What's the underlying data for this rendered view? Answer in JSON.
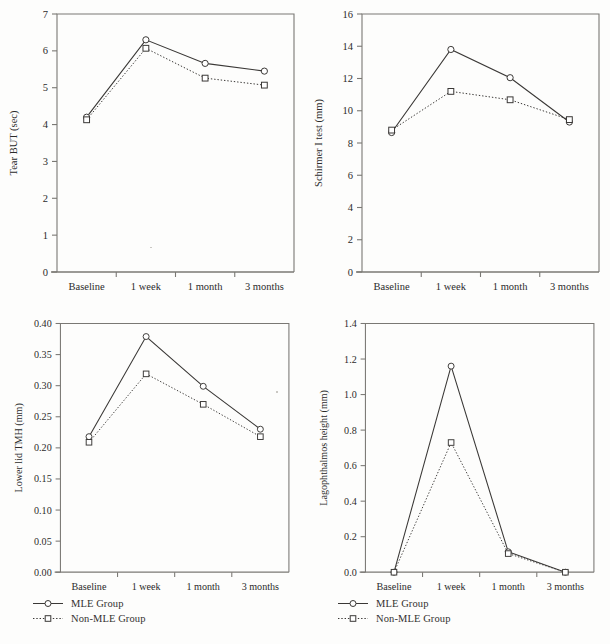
{
  "figure": {
    "background": "#fdfdfc",
    "axis_color": "#7a7874",
    "line_color": "#3a3836",
    "text_color": "#2b2b2b",
    "categories": [
      "Baseline",
      "1 week",
      "1 month",
      "3 months"
    ],
    "legend": {
      "items": [
        {
          "label": "MLE Group",
          "marker": "circle-marker",
          "line": "solid"
        },
        {
          "label": "Non-MLE Group",
          "marker": "square-marker",
          "line": "dotted"
        }
      ]
    }
  },
  "chart_data": [
    {
      "id": "tear-but",
      "type": "line",
      "title": "",
      "xlabel": "",
      "ylabel": "Tear BUT (sec)",
      "categories": [
        "Baseline",
        "1 week",
        "1 month",
        "3 months"
      ],
      "ylim": [
        0,
        7
      ],
      "yticks": [
        0,
        1,
        2,
        3,
        4,
        5,
        6,
        7
      ],
      "ytick_labels": [
        "0",
        "1",
        "2",
        "3",
        "4",
        "5",
        "6",
        "7"
      ],
      "grid": false,
      "legend_position": "none",
      "series": [
        {
          "name": "MLE Group",
          "values": [
            4.2,
            6.3,
            5.66,
            5.45
          ],
          "line": "solid",
          "marker": "circle-marker"
        },
        {
          "name": "Non-MLE Group",
          "values": [
            4.13,
            6.07,
            5.26,
            5.07
          ],
          "line": "dotted",
          "marker": "square-marker"
        }
      ]
    },
    {
      "id": "schirmer-i-test",
      "type": "line",
      "title": "",
      "xlabel": "",
      "ylabel": "Schirmer I test (mm)",
      "categories": [
        "Baseline",
        "1 week",
        "1 month",
        "3 months"
      ],
      "ylim": [
        0,
        16
      ],
      "yticks": [
        0,
        2,
        4,
        6,
        8,
        10,
        12,
        14,
        16
      ],
      "ytick_labels": [
        "0",
        "2",
        "4",
        "6",
        "8",
        "10",
        "12",
        "14",
        "16"
      ],
      "grid": false,
      "legend_position": "none",
      "series": [
        {
          "name": "MLE Group",
          "values": [
            8.65,
            13.8,
            12.05,
            9.3
          ],
          "line": "solid",
          "marker": "circle-marker"
        },
        {
          "name": "Non-MLE Group",
          "values": [
            8.8,
            11.2,
            10.68,
            9.45
          ],
          "line": "dotted",
          "marker": "square-marker"
        }
      ]
    },
    {
      "id": "lower-lid-tmh",
      "type": "line",
      "title": "",
      "xlabel": "",
      "ylabel": "Lower lid TMH (mm)",
      "categories": [
        "Baseline",
        "1 week",
        "1 month",
        "3 months"
      ],
      "ylim": [
        0.0,
        0.4
      ],
      "yticks": [
        0.0,
        0.05,
        0.1,
        0.15,
        0.2,
        0.25,
        0.3,
        0.35,
        0.4
      ],
      "ytick_labels": [
        "0.00",
        "0.05",
        "0.10",
        "0.15",
        "0.20",
        "0.25",
        "0.30",
        "0.35",
        "0.40"
      ],
      "grid": false,
      "legend_position": "below",
      "series": [
        {
          "name": "MLE Group",
          "values": [
            0.218,
            0.379,
            0.299,
            0.23
          ],
          "line": "solid",
          "marker": "circle-marker"
        },
        {
          "name": "Non-MLE Group",
          "values": [
            0.209,
            0.319,
            0.27,
            0.218
          ],
          "line": "dotted",
          "marker": "square-marker"
        }
      ]
    },
    {
      "id": "lagophthalmos-height",
      "type": "line",
      "title": "",
      "xlabel": "",
      "ylabel": "Lagophthalmos height (mm)",
      "categories": [
        "Baseline",
        "1 week",
        "1 month",
        "3 months"
      ],
      "ylim": [
        0.0,
        1.4
      ],
      "yticks": [
        0.0,
        0.2,
        0.4,
        0.6,
        0.8,
        1.0,
        1.2,
        1.4
      ],
      "ytick_labels": [
        "0.0",
        "0.2",
        "0.4",
        "0.6",
        "0.8",
        "1.0",
        "1.2",
        "1.4"
      ],
      "grid": false,
      "legend_position": "below",
      "series": [
        {
          "name": "MLE Group",
          "values": [
            0.0,
            1.16,
            0.115,
            0.0
          ],
          "line": "solid",
          "marker": "circle-marker"
        },
        {
          "name": "Non-MLE Group",
          "values": [
            0.0,
            0.73,
            0.105,
            0.0
          ],
          "line": "dotted",
          "marker": "square-marker"
        }
      ]
    }
  ]
}
